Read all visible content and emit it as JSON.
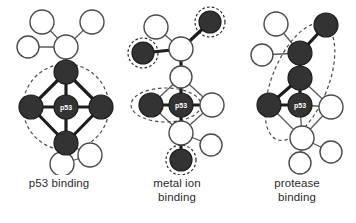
{
  "figure": {
    "background_color": "#ffffff",
    "node_fill_dark": "#333333",
    "node_fill_light": "#ffffff",
    "edge_color": "#5a5a5a",
    "highlight_stroke": "#4a4a4a",
    "center_label": "p53"
  },
  "panels": [
    {
      "id": "p53-binding",
      "caption_line1": "p53 binding",
      "caption_line2": "",
      "center_label": "p53",
      "highlight_shape": "circle",
      "highlight_description": "dashed circle around p53 and its four dark neighbours"
    },
    {
      "id": "metal-ion-binding",
      "caption_line1": "metal ion",
      "caption_line2": "binding",
      "center_label": "p53",
      "highlight_shape": "ellipse-plus-halos",
      "highlight_description": "dashed ellipse around p53 and left dark node, plus dashed halos on three peripheral dark nodes"
    },
    {
      "id": "protease-binding",
      "caption_line1": "protease",
      "caption_line2": "binding",
      "center_label": "p53",
      "highlight_shape": "tilted-ellipse",
      "highlight_description": "large tilted dashed ellipse enclosing the dark chain running up and right from p53"
    }
  ]
}
